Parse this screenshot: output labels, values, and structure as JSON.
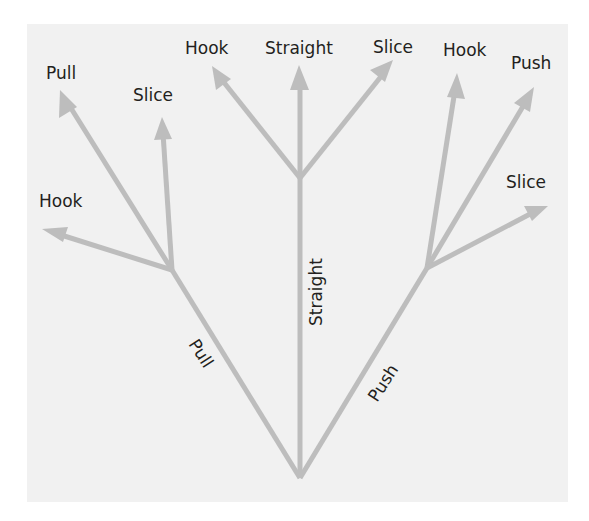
{
  "diagram": {
    "title": "",
    "colors": {
      "background": "#f1f1f1",
      "line": "#bdbdbd",
      "text": "#231f20"
    },
    "trunk_labels": {
      "left": "Pull",
      "middle": "Straight",
      "right": "Push"
    },
    "branches": {
      "left": {
        "trunk": "Pull",
        "leaves": [
          "Pull",
          "Slice",
          "Hook"
        ]
      },
      "middle": {
        "trunk": "Straight",
        "leaves": [
          "Hook",
          "Straight",
          "Slice"
        ]
      },
      "right": {
        "trunk": "Push",
        "leaves": [
          "Hook",
          "Push",
          "Slice"
        ]
      }
    },
    "leaf_labels": {
      "left_pull": "Pull",
      "left_slice": "Slice",
      "left_hook": "Hook",
      "mid_hook": "Hook",
      "mid_straight": "Straight",
      "mid_slice": "Slice",
      "right_hook": "Hook",
      "right_push": "Push",
      "right_slice": "Slice"
    }
  }
}
